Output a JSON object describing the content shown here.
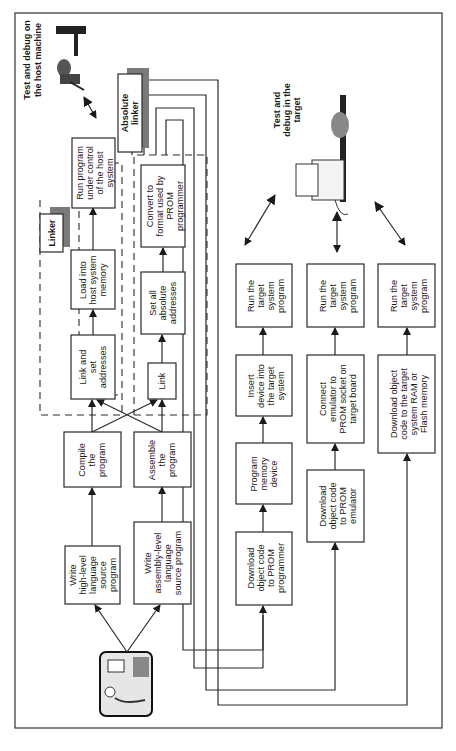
{
  "orientation": "rotated 90° counter-clockwise (text reads bottom-to-top)",
  "labels": {
    "host_test": [
      "Test and debug on",
      "the host machine"
    ],
    "target_test": [
      "Test and",
      "debug in the",
      "target"
    ],
    "linker": "Linker",
    "absolute_linker": [
      "Absolute",
      "linker"
    ]
  },
  "boxes": {
    "write_hll": [
      "Write",
      "high-level",
      "language",
      "source",
      "program"
    ],
    "write_asm": [
      "Write",
      "assembly-level",
      "language",
      "source program"
    ],
    "compile": [
      "Compile",
      "the",
      "program"
    ],
    "assemble": [
      "Assemble",
      "the",
      "program"
    ],
    "link_set": [
      "Link and",
      "set",
      "addresses"
    ],
    "link": [
      "Link"
    ],
    "load_host": [
      "Load into",
      "host system",
      "memory"
    ],
    "set_abs": [
      "Set all",
      "absolute",
      "addresses"
    ],
    "run_host": [
      "Run program",
      "under control",
      "of the host",
      "system"
    ],
    "convert": [
      "Convert to",
      "format used by",
      "PROM",
      "programmer"
    ],
    "dl_prom_prog": [
      "Download",
      "object code",
      "to PROM",
      "programmer"
    ],
    "program_mem": [
      "Program",
      "memory",
      "device"
    ],
    "insert_dev": [
      "Insert",
      "device into",
      "the target",
      "system"
    ],
    "run_target_1": [
      "Run the",
      "target",
      "system",
      "program"
    ],
    "dl_prom_emu": [
      "Download",
      "object code",
      "to PROM",
      "emulator"
    ],
    "connect_emu": [
      "Connect",
      "emulator to",
      "PROM socket on",
      "target board"
    ],
    "run_target_2": [
      "Run the",
      "target",
      "system",
      "program"
    ],
    "dl_ram_flash": [
      "Download object",
      "code to the target",
      "system RAM or",
      "Flash memory"
    ],
    "run_target_3": [
      "Run the",
      "target",
      "system",
      "program"
    ]
  },
  "icons": {
    "programmer": "programmer-at-desk-icon",
    "host_debugger": "person-debugging-at-desk-icon",
    "target_debugger": "person-with-target-board-icon"
  }
}
